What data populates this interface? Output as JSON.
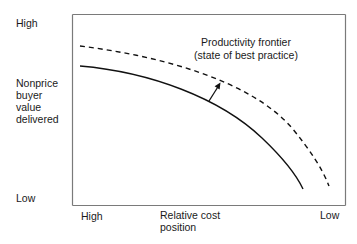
{
  "diagram": {
    "type": "productivity-frontier",
    "y_axis": {
      "label_lines": [
        "Nonprice",
        "buyer",
        "value",
        "delivered"
      ],
      "high_label": "High",
      "low_label": "Low"
    },
    "x_axis": {
      "label_lines": [
        "Relative cost",
        "position"
      ],
      "high_label": "High",
      "low_label": "Low"
    },
    "annotation": {
      "lines": [
        "Productivity frontier",
        "(state of best practice)"
      ]
    },
    "curves": [
      {
        "name": "current-position-curve",
        "style": "solid",
        "color": "#111111"
      },
      {
        "name": "productivity-frontier-curve",
        "style": "dashed",
        "color": "#111111"
      }
    ],
    "arrow": {
      "direction": "outward-toward-frontier",
      "color": "#111111"
    },
    "frame_color": "#7a7a7a"
  }
}
